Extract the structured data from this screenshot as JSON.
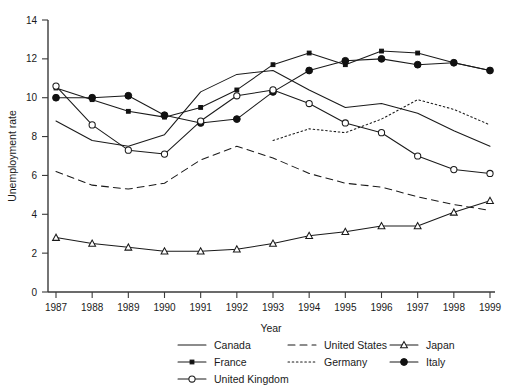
{
  "chart_data": {
    "type": "line",
    "title": "",
    "xlabel": "Year",
    "ylabel": "Unemployment rate",
    "x": [
      1987,
      1988,
      1989,
      1990,
      1991,
      1992,
      1993,
      1994,
      1995,
      1996,
      1997,
      1998,
      1999
    ],
    "xtick_labels": [
      "1987",
      "1988",
      "1989",
      "1990",
      "1991",
      "1992",
      "1993",
      "1994",
      "1995",
      "1996",
      "1997",
      "1998",
      "1999"
    ],
    "ytick_labels": [
      "0",
      "2",
      "4",
      "6",
      "8",
      "10",
      "12",
      "14"
    ],
    "yticks": [
      0,
      2,
      4,
      6,
      8,
      10,
      12,
      14
    ],
    "xlim": [
      1987,
      1999
    ],
    "ylim": [
      0,
      14
    ],
    "grid": false,
    "legend_position": "below-axes",
    "series": [
      {
        "name": "Canada",
        "style": "solid",
        "marker": "none",
        "values": [
          8.8,
          7.8,
          7.5,
          8.1,
          10.3,
          11.2,
          11.4,
          10.4,
          9.5,
          9.7,
          9.2,
          8.3,
          7.5
        ]
      },
      {
        "name": "United States",
        "style": "dashed",
        "marker": "none",
        "values": [
          6.2,
          5.5,
          5.3,
          5.6,
          6.8,
          7.5,
          6.9,
          6.1,
          5.6,
          5.4,
          4.9,
          4.5,
          4.2
        ]
      },
      {
        "name": "Japan",
        "style": "solid",
        "marker": "open-triangle",
        "values": [
          2.8,
          2.5,
          2.3,
          2.1,
          2.1,
          2.2,
          2.5,
          2.9,
          3.1,
          3.4,
          3.4,
          4.1,
          4.7
        ]
      },
      {
        "name": "France",
        "style": "solid",
        "marker": "small-square",
        "values": [
          10.5,
          9.9,
          9.3,
          9.0,
          9.5,
          10.4,
          11.7,
          12.3,
          11.7,
          12.4,
          12.3,
          11.8,
          11.4
        ]
      },
      {
        "name": "Germany",
        "style": "dotted",
        "marker": "none",
        "values": [
          null,
          null,
          null,
          null,
          null,
          null,
          7.8,
          8.4,
          8.2,
          8.9,
          9.9,
          9.4,
          8.6
        ]
      },
      {
        "name": "Italy",
        "style": "solid",
        "marker": "filled-circle",
        "values": [
          10.0,
          10.0,
          10.1,
          9.1,
          8.7,
          8.9,
          10.3,
          11.4,
          11.9,
          12.0,
          11.7,
          11.8,
          11.4
        ]
      },
      {
        "name": "United Kingdom",
        "style": "solid",
        "marker": "open-circle",
        "values": [
          10.6,
          8.6,
          7.3,
          7.1,
          8.8,
          10.1,
          10.4,
          9.7,
          8.7,
          8.2,
          7.0,
          6.3,
          6.1
        ]
      }
    ]
  },
  "legend": {
    "entries": [
      {
        "label": "Canada",
        "key": "canada"
      },
      {
        "label": "United States",
        "key": "united-states"
      },
      {
        "label": "Japan",
        "key": "japan"
      },
      {
        "label": "France",
        "key": "france"
      },
      {
        "label": "Germany",
        "key": "germany"
      },
      {
        "label": "Italy",
        "key": "italy"
      },
      {
        "label": "United Kingdom",
        "key": "united-kingdom"
      }
    ]
  },
  "colors": {
    "ink": "#1a1a1a",
    "axis": "#3a3a3a",
    "background": "#ffffff"
  }
}
